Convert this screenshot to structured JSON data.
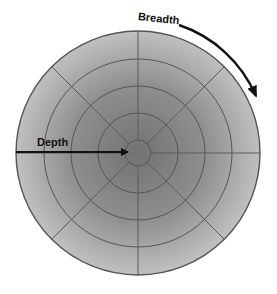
{
  "diagram": {
    "labels": {
      "depth": "Depth",
      "breadth": "Breadth"
    },
    "geometry": {
      "center": [
        138,
        153
      ],
      "ring_radii": [
        13,
        40,
        67,
        94,
        122
      ],
      "spoke_angles_deg": [
        0,
        45,
        90,
        135,
        180,
        225,
        270,
        315
      ]
    },
    "colors": {
      "center_fill": "#767676",
      "edge_fill": "#bdbdbd",
      "grid_line": "#555555",
      "arrow": "#111111",
      "background": "#ffffff"
    }
  }
}
